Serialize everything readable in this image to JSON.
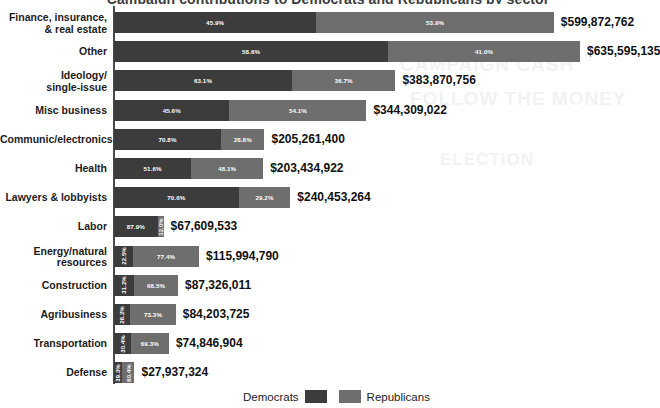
{
  "chart_data": {
    "type": "bar",
    "subtype": "stacked-horizontal-100pct",
    "title": "Campaign contributions to Democrats and Republicans by sector",
    "xlabel": "",
    "ylabel": "",
    "grid": false,
    "legend_position": "bottom-center",
    "value_prefix": "$",
    "series": [
      {
        "name": "Democrats",
        "color": "#3c3c3c"
      },
      {
        "name": "Republicans",
        "color": "#6e6e6e"
      }
    ],
    "categories": [
      "Finance, insurance,\n& real estate",
      "Other",
      "Ideology/\nsingle-issue",
      "Misc business",
      "Communic/electronics",
      "Health",
      "Lawyers & lobbyists",
      "Labor",
      "Energy/natural\nresources",
      "Construction",
      "Agribusiness",
      "Transportation",
      "Defense"
    ],
    "rows": [
      {
        "category_line1": "Finance, insurance,",
        "category_line2": "& real estate",
        "dem_pct": 45.9,
        "rep_pct": 53.9,
        "dem_pct_label": "45.9%",
        "rep_pct_label": "53.9%",
        "total": 599872762,
        "total_label": "$599,872,762"
      },
      {
        "category_line1": "Other",
        "category_line2": "",
        "dem_pct": 58.6,
        "rep_pct": 41.0,
        "dem_pct_label": "58.6%",
        "rep_pct_label": "41.0%",
        "total": 635595135,
        "total_label": "$635,595,135"
      },
      {
        "category_line1": "Ideology/",
        "category_line2": "single-issue",
        "dem_pct": 63.1,
        "rep_pct": 36.7,
        "dem_pct_label": "63.1%",
        "rep_pct_label": "36.7%",
        "total": 383870756,
        "total_label": "$383,870,756"
      },
      {
        "category_line1": "Misc business",
        "category_line2": "",
        "dem_pct": 45.6,
        "rep_pct": 54.1,
        "dem_pct_label": "45.6%",
        "rep_pct_label": "54.1%",
        "total": 344309022,
        "total_label": "$344,309,022"
      },
      {
        "category_line1": "Communic/electronics",
        "category_line2": "",
        "dem_pct": 70.8,
        "rep_pct": 28.8,
        "dem_pct_label": "70.8%",
        "rep_pct_label": "28.8%",
        "total": 205261400,
        "total_label": "$205,261,400"
      },
      {
        "category_line1": "Health",
        "category_line2": "",
        "dem_pct": 51.6,
        "rep_pct": 48.1,
        "dem_pct_label": "51.6%",
        "rep_pct_label": "48.1%",
        "total": 203434922,
        "total_label": "$203,434,922"
      },
      {
        "category_line1": "Lawyers & lobbyists",
        "category_line2": "",
        "dem_pct": 70.6,
        "rep_pct": 29.2,
        "dem_pct_label": "70.6%",
        "rep_pct_label": "29.2%",
        "total": 240453264,
        "total_label": "$240,453,264"
      },
      {
        "category_line1": "Labor",
        "category_line2": "",
        "dem_pct": 87.9,
        "rep_pct": 12.0,
        "dem_pct_label": "87.9%",
        "rep_pct_label": "12.0%",
        "total": 67609533,
        "total_label": "$67,609,533"
      },
      {
        "category_line1": "Energy/natural",
        "category_line2": "resources",
        "dem_pct": 22.5,
        "rep_pct": 77.4,
        "dem_pct_label": "22.5%",
        "rep_pct_label": "77.4%",
        "total": 115994790,
        "total_label": "$115,994,790"
      },
      {
        "category_line1": "Construction",
        "category_line2": "",
        "dem_pct": 31.2,
        "rep_pct": 68.5,
        "dem_pct_label": "31.2%",
        "rep_pct_label": "68.5%",
        "total": 87326011,
        "total_label": "$87,326,011"
      },
      {
        "category_line1": "Agribusiness",
        "category_line2": "",
        "dem_pct": 26.2,
        "rep_pct": 73.3,
        "dem_pct_label": "26.2%",
        "rep_pct_label": "73.3%",
        "total": 84203725,
        "total_label": "$84,203,725"
      },
      {
        "category_line1": "Transportation",
        "category_line2": "",
        "dem_pct": 30.4,
        "rep_pct": 69.3,
        "dem_pct_label": "30.4%",
        "rep_pct_label": "69.3%",
        "total": 74846904,
        "total_label": "$74,846,904"
      },
      {
        "category_line1": "Defense",
        "category_line2": "",
        "dem_pct": 39.3,
        "rep_pct": 60.4,
        "dem_pct_label": "39.3%",
        "rep_pct_label": "60.4%",
        "total": 27937324,
        "total_label": "$27,937,324"
      }
    ],
    "max_total": 635595135,
    "legend": [
      {
        "label": "Democrats",
        "color": "#3c3c3c"
      },
      {
        "label": "Republicans",
        "color": "#6e6e6e"
      }
    ]
  },
  "legend": {
    "democrats_label": "Democrats",
    "republicans_label": "Republicans"
  },
  "watermark": {
    "line1": "CAMPAIGN CASH",
    "line2": "FOLLOW THE MONEY",
    "line3": "ELECTION"
  }
}
